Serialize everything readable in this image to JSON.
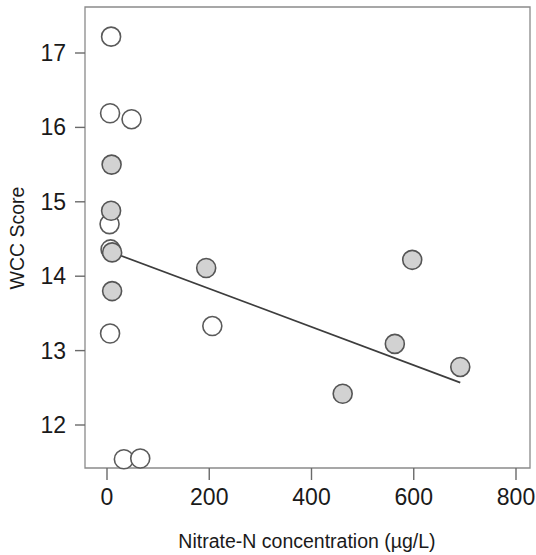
{
  "chart_data": {
    "type": "scatter",
    "title": "",
    "xlabel": "Nitrate-N concentration (µg/L)",
    "ylabel": "WCC Score",
    "xlim": [
      -30,
      830
    ],
    "ylim": [
      11.3,
      17.6
    ],
    "xticks": [
      0,
      200,
      400,
      600,
      800
    ],
    "yticks": [
      12,
      13,
      14,
      15,
      16,
      17
    ],
    "xticklabels": [
      "0",
      "200",
      "400",
      "600",
      "800"
    ],
    "yticklabels": [
      "12",
      "13",
      "14",
      "15",
      "16",
      "17"
    ],
    "grid": false,
    "legend": null,
    "series": [
      {
        "name": "open-markers",
        "marker": "open circle",
        "fill": "#ffffff",
        "edge": "#5a5a5a",
        "points": [
          {
            "x": 8,
            "y": 17.22
          },
          {
            "x": 6,
            "y": 16.19
          },
          {
            "x": 48,
            "y": 16.11
          },
          {
            "x": 5,
            "y": 14.7
          },
          {
            "x": 7,
            "y": 14.36
          },
          {
            "x": 6,
            "y": 13.23
          },
          {
            "x": 206,
            "y": 13.33
          },
          {
            "x": 33,
            "y": 11.54
          },
          {
            "x": 65,
            "y": 11.55
          }
        ]
      },
      {
        "name": "filled-markers",
        "marker": "filled circle",
        "fill": "#d2d2d2",
        "edge": "#555555",
        "points": [
          {
            "x": 9,
            "y": 15.5
          },
          {
            "x": 8,
            "y": 14.88
          },
          {
            "x": 10,
            "y": 14.32
          },
          {
            "x": 10,
            "y": 13.8
          },
          {
            "x": 194,
            "y": 14.11
          },
          {
            "x": 597,
            "y": 14.22
          },
          {
            "x": 563,
            "y": 13.09
          },
          {
            "x": 691,
            "y": 12.78
          },
          {
            "x": 461,
            "y": 12.42
          }
        ]
      }
    ],
    "trendline": {
      "name": "regression-line",
      "color": "#3d3d3d",
      "x_start": 6,
      "y_start": 14.33,
      "x_end": 691,
      "y_end": 12.57
    }
  }
}
